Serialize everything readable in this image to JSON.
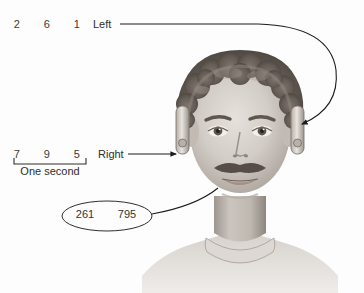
{
  "figure": {
    "background_color": "#fdfdfd",
    "ink_color": "#2e2e2e"
  },
  "left_channel": {
    "label": "Left",
    "digits": [
      "2",
      "6",
      "1"
    ]
  },
  "right_channel": {
    "label": "Right",
    "digits": [
      "7",
      "9",
      "5"
    ]
  },
  "time_scale": {
    "caption": "One second"
  },
  "recall_ellipse": {
    "items": [
      "261",
      "795"
    ]
  },
  "icons": {
    "left_connector": "curved-arrow-icon",
    "right_connector": "straight-arrow-icon",
    "callout": "ellipse-callout-icon",
    "portrait": "head-with-headphones-icon",
    "scale_bar": "time-scale-bar-icon"
  }
}
